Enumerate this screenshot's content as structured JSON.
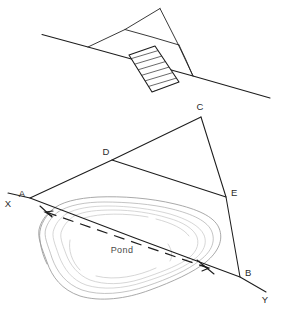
{
  "figure": {
    "background_color": "#ffffff",
    "line_color": "#1d1d1d",
    "contour_color": "#9a9a9a",
    "labels": {
      "pond": "Pond",
      "point_a": "A",
      "point_b": "B",
      "point_c": "C",
      "point_d": "D",
      "point_e": "E",
      "axis_x": "X",
      "axis_y": "Y"
    }
  },
  "upper_diagram": {
    "name": "inset-detail-view",
    "description": "Sloped baseline with triangle and hatched rectangular block",
    "baseline": "from (42,35) to (270,98)",
    "triangle_apex": "(160,8)",
    "hatched_block_angle_deg": 24
  },
  "lower_diagram": {
    "name": "pond-triangulation-plan",
    "description": "Survey triangle A-C-B around a pond with offset line D-E and baseline X-Y",
    "points": {
      "A": {
        "x": 30,
        "y": 198
      },
      "B": {
        "x": 240,
        "y": 277
      },
      "C": {
        "x": 201,
        "y": 116
      },
      "D": {
        "x": 112,
        "y": 160
      },
      "E": {
        "x": 226,
        "y": 197
      }
    },
    "baseline_x_end": {
      "x": 8,
      "y": 193
    },
    "baseline_y_end": {
      "x": 266,
      "y": 292
    },
    "dashed_measure": "A-to-B centreline across pond"
  }
}
